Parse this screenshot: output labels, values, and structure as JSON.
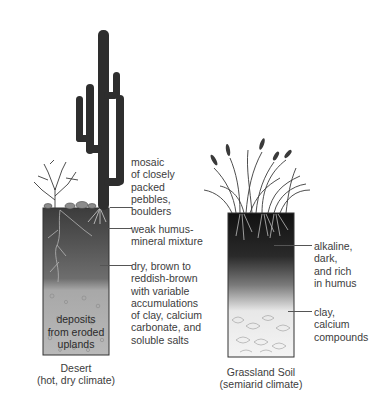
{
  "figure": {
    "desert": {
      "caption_title": "Desert",
      "caption_sub": "(hot, dry climate)",
      "labels": {
        "surface": "mosaic\nof closely\npacked\npebbles,\nboulders",
        "topsoil": "weak humus-\nmineral mixture",
        "subsoil": "dry, brown to\nreddish-brown\nwith variable\naccumulations\nof clay, calcium\ncarbonate, and\nsoluble salts",
        "bottom": "deposits\nfrom eroded\nuplands"
      },
      "colors": {
        "top": "#3f3f3f",
        "middle": "#6a6a6a",
        "bottom": "#b8b8b8"
      }
    },
    "grassland": {
      "caption_title": "Grassland Soil",
      "caption_sub": "(semiarid climate)",
      "labels": {
        "topsoil": "alkaline,\ndark,\nand rich\nin humus",
        "subsoil": "clay,\ncalcium\ncompounds"
      },
      "colors": {
        "top": "#151515",
        "middle": "#8a8a8a",
        "bottom": "#f2f2f2"
      }
    }
  }
}
